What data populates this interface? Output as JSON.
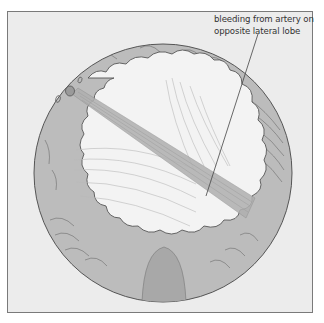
{
  "figure": {
    "type": "endoscopic anatomical illustration",
    "annotations": [
      {
        "id": "bleeding-artery",
        "lines": [
          "bleeding from artery on",
          "opposite lateral lobe"
        ]
      }
    ],
    "colors": {
      "background": "#ececec",
      "ring": "#bcbcbc",
      "lumen": "#f2f2f2",
      "jet": "#b5b5b5",
      "outline": "#555555",
      "frame_border": "#7a7a7a",
      "text": "#333333"
    }
  }
}
